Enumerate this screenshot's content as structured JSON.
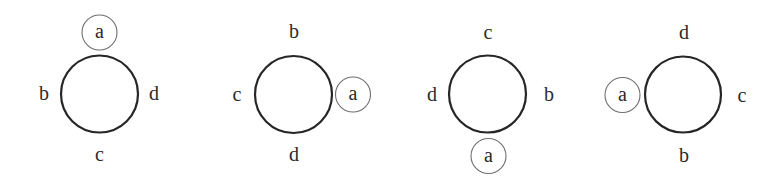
{
  "diagram": {
    "style": {
      "main_circle_stroke": "#262626",
      "marker_circle_stroke": "#6e6e6e",
      "label_color": "#2a2a2a",
      "background": "#ffffff"
    },
    "figures": [
      {
        "id": 1,
        "center": [
          99.5,
          94
        ],
        "radius": 38.5,
        "labels": {
          "top": {
            "text": "a",
            "x": 99.5,
            "y": 32.5,
            "circled": true
          },
          "left": {
            "text": "b",
            "x": 44,
            "y": 94,
            "circled": false
          },
          "right": {
            "text": "d",
            "x": 154,
            "y": 94,
            "circled": false
          },
          "bottom": {
            "text": "c",
            "x": 99.5,
            "y": 155,
            "circled": false
          }
        }
      },
      {
        "id": 2,
        "center": [
          293.5,
          94.5
        ],
        "radius": 38.5,
        "labels": {
          "top": {
            "text": "b",
            "x": 294,
            "y": 32,
            "circled": false
          },
          "left": {
            "text": "c",
            "x": 237,
            "y": 95,
            "circled": false
          },
          "right": {
            "text": "a",
            "x": 353,
            "y": 94.5,
            "circled": true
          },
          "bottom": {
            "text": "d",
            "x": 294,
            "y": 155,
            "circled": false
          }
        }
      },
      {
        "id": 3,
        "center": [
          487.5,
          94
        ],
        "radius": 38.5,
        "labels": {
          "top": {
            "text": "c",
            "x": 488,
            "y": 33,
            "circled": false
          },
          "left": {
            "text": "d",
            "x": 432,
            "y": 95,
            "circled": false
          },
          "right": {
            "text": "b",
            "x": 549,
            "y": 95,
            "circled": false
          },
          "bottom": {
            "text": "a",
            "x": 488.5,
            "y": 156,
            "circled": true
          }
        }
      },
      {
        "id": 4,
        "center": [
          683,
          94.5
        ],
        "radius": 38,
        "labels": {
          "top": {
            "text": "d",
            "x": 684,
            "y": 33,
            "circled": false
          },
          "left": {
            "text": "a",
            "x": 622.5,
            "y": 95,
            "circled": true
          },
          "right": {
            "text": "c",
            "x": 742,
            "y": 96,
            "circled": false
          },
          "bottom": {
            "text": "b",
            "x": 684,
            "y": 156,
            "circled": false
          }
        }
      }
    ],
    "marker_radius": 17.5
  }
}
